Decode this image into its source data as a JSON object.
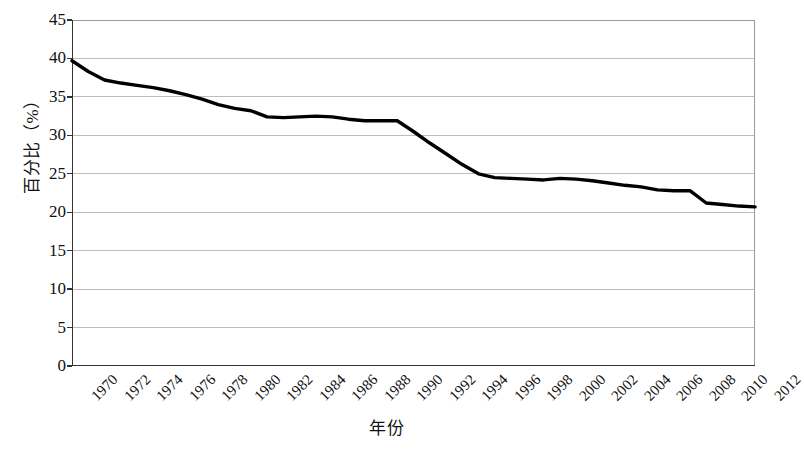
{
  "chart_data": {
    "type": "line",
    "title": "",
    "subtitle": "",
    "xlabel": "年份",
    "ylabel": "百分比（%）",
    "xlim": [
      1970,
      2012
    ],
    "ylim": [
      0,
      45
    ],
    "grid": "horizontal",
    "legend": "none",
    "y_ticks": [
      0,
      5,
      10,
      15,
      20,
      25,
      30,
      35,
      40,
      45
    ],
    "y_tick_labels": [
      "0",
      "5",
      "10",
      "15",
      "20",
      "25",
      "30",
      "35",
      "40",
      "45"
    ],
    "x_ticks": [
      1970,
      1972,
      1974,
      1976,
      1978,
      1980,
      1982,
      1984,
      1986,
      1988,
      1990,
      1992,
      1994,
      1996,
      1998,
      2000,
      2002,
      2004,
      2006,
      2008,
      2010,
      2012
    ],
    "x_tick_labels": [
      "1970",
      "1972",
      "1974",
      "1976",
      "1978",
      "1980",
      "1982",
      "1984",
      "1986",
      "1988",
      "1990",
      "1992",
      "1994",
      "1996",
      "1998",
      "2000",
      "2002",
      "2004",
      "2006",
      "2008",
      "2010",
      "2012"
    ],
    "x_tick_rotation": -45,
    "line_color": "#000000",
    "line_width": 3.4,
    "grid_color": "#bdbdbd",
    "border_color": "#9a9a9a",
    "axis_color": "#333333",
    "background": "#ffffff",
    "x": [
      1970,
      1971,
      1972,
      1973,
      1974,
      1975,
      1976,
      1977,
      1978,
      1979,
      1980,
      1981,
      1982,
      1983,
      1984,
      1985,
      1986,
      1987,
      1988,
      1989,
      1990,
      1991,
      1992,
      1993,
      1994,
      1995,
      1996,
      1997,
      1998,
      1999,
      2000,
      2001,
      2002,
      2003,
      2004,
      2005,
      2006,
      2007,
      2008,
      2009,
      2010,
      2011,
      2012
    ],
    "values": [
      39.7,
      38.3,
      37.2,
      36.8,
      36.5,
      36.2,
      35.8,
      35.3,
      34.7,
      34.0,
      33.5,
      33.2,
      32.4,
      32.3,
      32.4,
      32.5,
      32.4,
      32.1,
      31.9,
      31.9,
      31.9,
      30.5,
      29.0,
      27.6,
      26.2,
      25.0,
      24.5,
      24.4,
      24.3,
      24.2,
      24.4,
      24.3,
      24.1,
      23.8,
      23.5,
      23.3,
      22.9,
      22.8,
      22.8,
      21.2,
      21.0,
      20.8,
      20.7
    ],
    "series": [
      {
        "name": "百分比",
        "values": [
          39.7,
          38.3,
          37.2,
          36.8,
          36.5,
          36.2,
          35.8,
          35.3,
          34.7,
          34.0,
          33.5,
          33.2,
          32.4,
          32.3,
          32.4,
          32.5,
          32.4,
          32.1,
          31.9,
          31.9,
          31.9,
          30.5,
          29.0,
          27.6,
          26.2,
          25.0,
          24.5,
          24.4,
          24.3,
          24.2,
          24.4,
          24.3,
          24.1,
          23.8,
          23.5,
          23.3,
          22.9,
          22.8,
          22.8,
          21.2,
          21.0,
          20.8,
          20.7
        ]
      }
    ]
  }
}
